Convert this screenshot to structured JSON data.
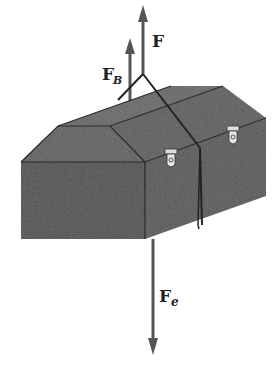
{
  "figure": {
    "labels": {
      "applied_force": "F",
      "buoyant_force_main": "F",
      "buoyant_force_sub": "B",
      "weight_force_main": "F",
      "weight_force_sub": "e"
    },
    "colors": {
      "box_side": "#5a5a5a",
      "box_front": "#4d4d4d",
      "box_top": "#636363",
      "arrow": "#555555",
      "edge": "#2a2a2a",
      "latch": "#e0e0e0"
    }
  }
}
